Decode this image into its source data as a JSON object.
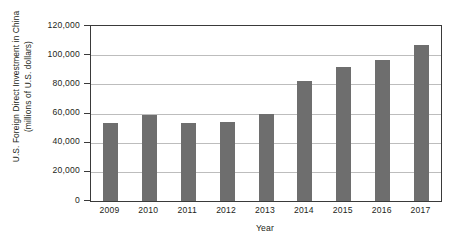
{
  "chart_data": {
    "type": "bar",
    "title": "",
    "xlabel": "Year",
    "ylabel": "U.S. Foreign Direct Investment in China (millions of U.S. dollars)",
    "ylabel_line1": "U.S. Foreign Direct Investment in China",
    "ylabel_line2": "(millions of U.S. dollars)",
    "categories": [
      "2009",
      "2010",
      "2011",
      "2012",
      "2013",
      "2014",
      "2015",
      "2016",
      "2017"
    ],
    "values": [
      53800,
      59000,
      53800,
      54200,
      59700,
      82000,
      91700,
      96700,
      107000
    ],
    "ylim": [
      0,
      120000
    ],
    "ytick_labels": [
      "0",
      "20,000",
      "40,000",
      "60,000",
      "80,000",
      "100,000",
      "120,000"
    ],
    "ytick_values": [
      0,
      20000,
      40000,
      60000,
      80000,
      100000,
      120000
    ],
    "grid": true,
    "legend": "none",
    "bar_color": "#6e6e6e",
    "axis_color": "#3a3a3a",
    "gridline_color": "#bdbdbd",
    "background_color": "#ffffff"
  }
}
